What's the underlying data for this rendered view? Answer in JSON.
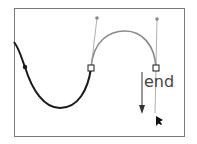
{
  "diagram": {
    "label": "end",
    "colors": {
      "drawn_path": "#1a1a1a",
      "preview_path": "#8a8a8a",
      "handle_line": "#9a9a9a",
      "frame": "#7a7a7a"
    },
    "icons": [
      "anchor-point-icon",
      "direction-handle-icon",
      "arrow-down-icon",
      "mouse-pointer-icon"
    ]
  }
}
